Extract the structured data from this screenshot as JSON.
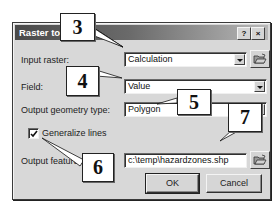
{
  "dialog": {
    "title": "Raster to F",
    "title_full_hint": "Raster to Features",
    "help_label": "?",
    "close_label": "×"
  },
  "form": {
    "input_raster": {
      "label": "Input raster:",
      "value": "Calculation"
    },
    "field": {
      "label": "Field:",
      "value": "Value"
    },
    "output_geometry_type": {
      "label": "Output geometry type:",
      "value": "Polygon"
    },
    "generalize_lines": {
      "label": "Generalize lines",
      "checked": true
    },
    "output_features": {
      "label": "Output features:",
      "value": "c:\\temp\\hazardzones.shp"
    }
  },
  "buttons": {
    "ok": "OK",
    "cancel": "Cancel"
  },
  "callouts": [
    {
      "number": "3",
      "target": "input-raster"
    },
    {
      "number": "4",
      "target": "field"
    },
    {
      "number": "5",
      "target": "output-geometry-type"
    },
    {
      "number": "6",
      "target": "generalize-lines"
    },
    {
      "number": "7",
      "target": "output-features"
    }
  ],
  "colors": {
    "dialog_bg": "#d8d8d8",
    "titlebar_start": "#4a4a4a",
    "titlebar_end": "#b8b8b8",
    "field_bg": "#ffffff"
  }
}
